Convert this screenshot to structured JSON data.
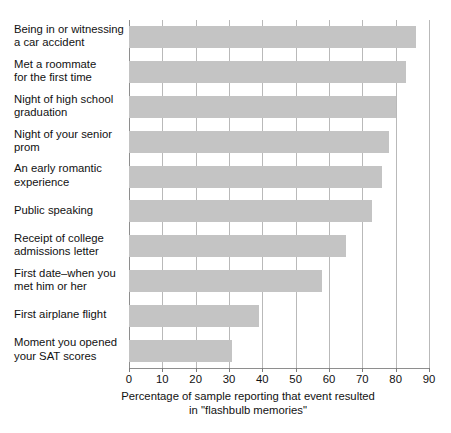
{
  "chart_data": {
    "type": "bar",
    "orientation": "horizontal",
    "title": "",
    "xlabel": "Percentage of sample reporting that event resulted in \"flashbulb memories\"",
    "xlabel_line1": "Percentage of sample reporting that event resulted",
    "xlabel_line2": "in \"flashbulb memories\"",
    "ylabel": "",
    "xlim": [
      0,
      90
    ],
    "xticks": [
      0,
      10,
      20,
      30,
      40,
      50,
      60,
      70,
      80,
      90
    ],
    "xtick_labels": [
      "0",
      "10",
      "20",
      "30",
      "40",
      "50",
      "60",
      "70",
      "80",
      "90"
    ],
    "grid": true,
    "grid_axis": "x",
    "legend": false,
    "bar_color": "#c4c4c4",
    "grid_color": "#b9b9b9",
    "axis_color": "#8e8e8e",
    "categories": [
      "Being in or witnessing\na car accident",
      "Met a roommate\nfor the first time",
      "Night of high school\ngraduation",
      "Night of your senior\nprom",
      "An early romantic\nexperience",
      "Public speaking",
      "Receipt of college\nadmissions letter",
      "First date–when you\nmet him or her",
      "First airplane flight",
      "Moment you opened\nyour SAT scores"
    ],
    "values": [
      86,
      83,
      80,
      78,
      76,
      73,
      65,
      58,
      39,
      31
    ]
  }
}
